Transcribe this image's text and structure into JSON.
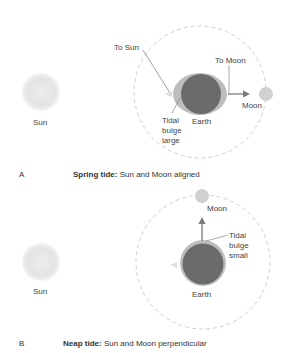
{
  "panel_a": {
    "letter": "A",
    "caption_bold": "Spring tide:",
    "caption_rest": " Sun and Moon aligned",
    "labels": {
      "sun": "Sun",
      "to_sun": "To Sun",
      "to_moon": "To Moon",
      "moon": "Moon",
      "earth": "Earth",
      "tidal_1": "Tidal",
      "tidal_2": "bulge",
      "tidal_3": "large"
    }
  },
  "panel_b": {
    "letter": "B",
    "caption_bold": "Neap tide:",
    "caption_rest": " Sun and Moon perpendicular",
    "labels": {
      "sun": "Sun",
      "moon": "Moon",
      "earth": "Earth",
      "tidal_1": "Tidal",
      "tidal_2": "bulge",
      "tidal_3": "small"
    }
  },
  "colors": {
    "earth": "#6b6b6b",
    "bulge": "#bdbdbd",
    "sun": "#e6e6e6",
    "moon": "#d0d0d0",
    "orbit": "#cfcfcf",
    "arrow": "#7a7a7a"
  }
}
